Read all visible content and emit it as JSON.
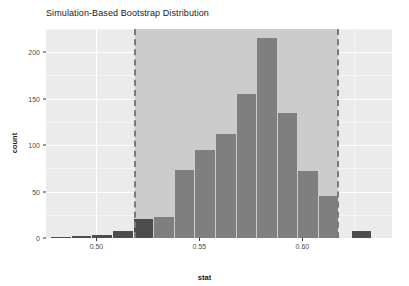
{
  "chart_data": {
    "type": "bar",
    "title": "Simulation-Based Bootstrap Distribution",
    "xlabel": "stat",
    "ylabel": "count",
    "xlim": [
      0.4755,
      0.6435
    ],
    "ylim": [
      0,
      225
    ],
    "bin_width": 0.01,
    "grid": true,
    "legend": null,
    "x_ticks": [
      0.5,
      0.55,
      0.6
    ],
    "x_tick_labels": [
      "0.50",
      "0.55",
      "0.60"
    ],
    "y_ticks": [
      0,
      50,
      100,
      150,
      200
    ],
    "y_tick_labels": [
      "0",
      "50",
      "100",
      "150",
      "200"
    ],
    "bars": [
      {
        "x_left": 0.478,
        "x_right": 0.488,
        "value": 1,
        "shaded": false
      },
      {
        "x_left": 0.488,
        "x_right": 0.498,
        "value": 2,
        "shaded": false
      },
      {
        "x_left": 0.498,
        "x_right": 0.508,
        "value": 3,
        "shaded": false
      },
      {
        "x_left": 0.508,
        "x_right": 0.518,
        "value": 8,
        "shaded": false
      },
      {
        "x_left": 0.518,
        "x_right": 0.528,
        "value": 20,
        "shaded": false
      },
      {
        "x_left": 0.528,
        "x_right": 0.538,
        "value": 23,
        "shaded": true
      },
      {
        "x_left": 0.538,
        "x_right": 0.548,
        "value": 73,
        "shaded": true
      },
      {
        "x_left": 0.548,
        "x_right": 0.558,
        "value": 95,
        "shaded": true
      },
      {
        "x_left": 0.558,
        "x_right": 0.568,
        "value": 112,
        "shaded": true
      },
      {
        "x_left": 0.568,
        "x_right": 0.578,
        "value": 155,
        "shaded": true
      },
      {
        "x_left": 0.578,
        "x_right": 0.588,
        "value": 215,
        "shaded": true
      },
      {
        "x_left": 0.588,
        "x_right": 0.598,
        "value": 135,
        "shaded": true
      },
      {
        "x_left": 0.598,
        "x_right": 0.608,
        "value": 72,
        "shaded": true
      },
      {
        "x_left": 0.608,
        "x_right": 0.618,
        "value": 45,
        "shaded": true
      },
      {
        "x_left": 0.624,
        "x_right": 0.634,
        "value": 8,
        "shaded": false
      }
    ],
    "ci_region": {
      "lower": 0.5185,
      "upper": 0.6175
    },
    "annotations": [
      {
        "type": "vline",
        "x": 0.5185,
        "style": "dashed",
        "color": "#7a7a7a"
      },
      {
        "type": "vline",
        "x": 0.6175,
        "style": "dashed",
        "color": "#7a7a7a"
      }
    ],
    "colors": {
      "panel_background": "#ebebeb",
      "gridline_major": "#ffffff",
      "gridline_minor": "#f5f5f5",
      "bar_shaded": "#7f7f7f",
      "bar_unshaded": "#4d4d4d",
      "ci_shade": "#cccccc",
      "ci_line": "#7a7a7a",
      "text": "#1a1a1a",
      "tick_text": "#4d4d4d",
      "figure_background": "#ffffff"
    }
  }
}
